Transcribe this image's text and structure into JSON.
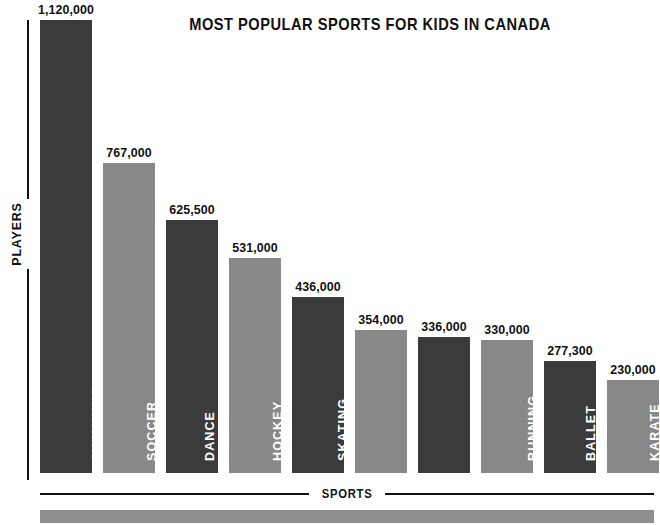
{
  "chart_data": {
    "type": "bar",
    "title": "MOST POPULAR SPORTS FOR KIDS IN CANADA",
    "xlabel": "SPORTS",
    "ylabel": "PLAYERS",
    "grid": false,
    "legend": "none",
    "ylim": [
      0,
      1120000
    ],
    "categories": [
      "SWIMMING",
      "SOCCER",
      "DANCE",
      "HOCKEY",
      "SKATING",
      "BASKETBALL",
      "GYMNASTICS",
      "RUNNING",
      "BALLET",
      "KARATE"
    ],
    "values": [
      1120000,
      767000,
      625500,
      531000,
      436000,
      354000,
      336000,
      330000,
      277300,
      230000
    ],
    "value_labels": [
      "1,120,000",
      "767,000",
      "625,500",
      "531,000",
      "436,000",
      "354,000",
      "336,000",
      "330,000",
      "277,300",
      "230,000"
    ],
    "bar_colors": [
      "#3b3b3b",
      "#888888",
      "#3b3b3b",
      "#888888",
      "#3b3b3b",
      "#888888",
      "#3b3b3b",
      "#888888",
      "#3b3b3b",
      "#888888"
    ]
  },
  "colors": {
    "dark_bar": "#3b3b3b",
    "light_bar": "#888888",
    "axis": "#111111",
    "footer_band": "#8e8e8e",
    "background": "#ffffff",
    "label_text": "#ffffff"
  }
}
